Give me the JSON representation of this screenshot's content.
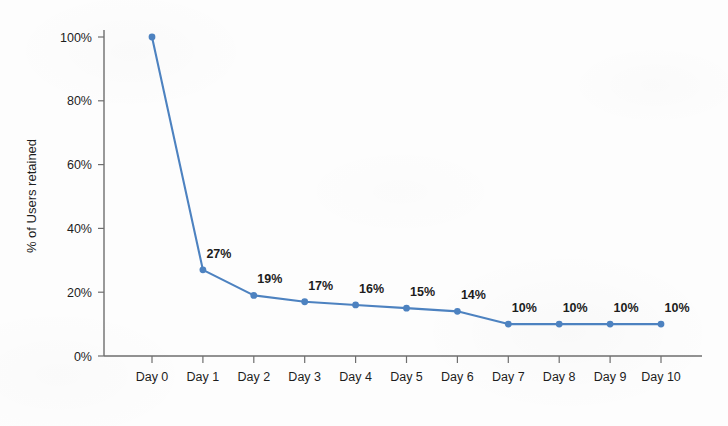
{
  "chart_data": {
    "type": "line",
    "title": "",
    "xlabel": "",
    "ylabel": "% of Users retained",
    "categories": [
      "Day 0",
      "Day 1",
      "Day 2",
      "Day 3",
      "Day 4",
      "Day 5",
      "Day 6",
      "Day 7",
      "Day 8",
      "Day 9",
      "Day 10"
    ],
    "values": [
      100,
      27,
      19,
      17,
      16,
      15,
      14,
      10,
      10,
      10,
      10
    ],
    "point_labels": [
      "",
      "27%",
      "19%",
      "17%",
      "16%",
      "15%",
      "14%",
      "10%",
      "10%",
      "10%",
      "10%"
    ],
    "ylim": [
      0,
      100
    ],
    "yticks": [
      0,
      20,
      40,
      60,
      80,
      100
    ],
    "ytick_labels": [
      "0%",
      "20%",
      "40%",
      "60%",
      "80%",
      "100%"
    ],
    "grid": false,
    "legend": "none",
    "series": [
      {
        "name": "% of Users retained",
        "color": "#4d82c0",
        "marker": "circle",
        "values": [
          100,
          27,
          19,
          17,
          16,
          15,
          14,
          10,
          10,
          10,
          10
        ]
      }
    ],
    "colors": {
      "line": "#4d82c0",
      "marker": "#4d82c0",
      "axis": "#6e6e6e",
      "text": "#1d1d1d",
      "background": "#fdfdfd"
    }
  },
  "axis": {
    "y_title": "% of Users retained"
  }
}
